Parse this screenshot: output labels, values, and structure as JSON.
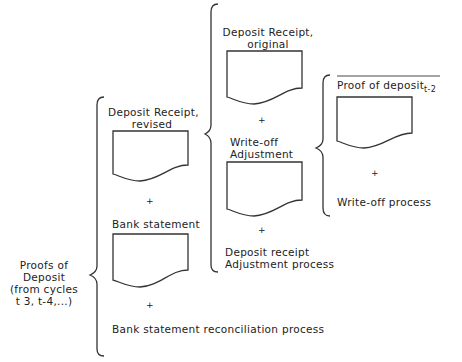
{
  "root": {
    "label_lines": [
      "Proofs of",
      "Deposit",
      "(from cycles",
      "t 3, t-4,...)"
    ]
  },
  "level1": {
    "items": [
      {
        "label_lines": [
          "Deposit Receipt,",
          "revised"
        ],
        "type": "document"
      },
      {
        "label": "+",
        "type": "operator"
      },
      {
        "label_lines": [
          "Bank statement"
        ],
        "type": "document"
      },
      {
        "label": "+",
        "type": "operator"
      },
      {
        "label": "Bank statement reconciliation process",
        "type": "process"
      }
    ]
  },
  "level2": {
    "items": [
      {
        "label_lines": [
          "Deposit Receipt,",
          "original"
        ],
        "type": "document"
      },
      {
        "label": "+",
        "type": "operator"
      },
      {
        "label_lines": [
          "Write-off",
          "Adjustment"
        ],
        "type": "document"
      },
      {
        "label": "+",
        "type": "operator"
      },
      {
        "label_lines": [
          "Deposit receipt",
          "Adjustment process"
        ],
        "type": "process"
      }
    ]
  },
  "level3": {
    "items": [
      {
        "label": "Proof of deposit",
        "subscript": "t-2",
        "type": "document"
      },
      {
        "label": "+",
        "type": "operator"
      },
      {
        "label": "Write-off process",
        "type": "process"
      }
    ]
  }
}
